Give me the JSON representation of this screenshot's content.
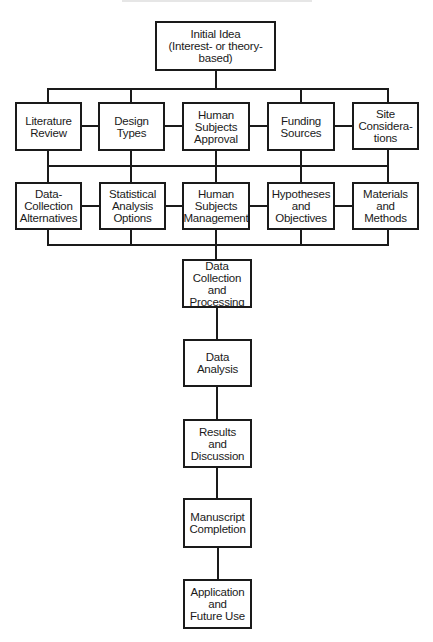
{
  "diagram": {
    "type": "flowchart",
    "root": {
      "id": "initial-idea",
      "label": "Initial Idea\n(Interest- or theory-based)"
    },
    "row1": [
      {
        "id": "literature-review",
        "label": "Literature\nReview"
      },
      {
        "id": "design-types",
        "label": "Design\nTypes"
      },
      {
        "id": "human-subjects-approval",
        "label": "Human\nSubjects\nApproval"
      },
      {
        "id": "funding-sources",
        "label": "Funding\nSources"
      },
      {
        "id": "site-considerations",
        "label": "Site\nConsidera-\ntions"
      }
    ],
    "row2": [
      {
        "id": "data-collection-alternatives",
        "label": "Data-\nCollection\nAlternatives"
      },
      {
        "id": "statistical-analysis-options",
        "label": "Statistical\nAnalysis\nOptions"
      },
      {
        "id": "human-subjects-management",
        "label": "Human\nSubjects\nManagement"
      },
      {
        "id": "hypotheses-and-objectives",
        "label": "Hypotheses\nand\nObjectives"
      },
      {
        "id": "materials-and-methods",
        "label": "Materials\nand\nMethods"
      }
    ],
    "sequence": [
      {
        "id": "data-collection-processing",
        "label": "Data\nCollection and\nProcessing"
      },
      {
        "id": "data-analysis",
        "label": "Data\nAnalysis"
      },
      {
        "id": "results-discussion",
        "label": "Results\nand\nDiscussion"
      },
      {
        "id": "manuscript-completion",
        "label": "Manuscript\nCompletion"
      },
      {
        "id": "application-future-use",
        "label": "Application\nand\nFuture Use"
      }
    ],
    "edges": [
      [
        "initial-idea",
        "row1"
      ],
      [
        "row1",
        "row2"
      ],
      [
        "row2",
        "data-collection-processing"
      ],
      [
        "data-collection-processing",
        "data-analysis"
      ],
      [
        "data-analysis",
        "results-discussion"
      ],
      [
        "results-discussion",
        "manuscript-completion"
      ],
      [
        "manuscript-completion",
        "application-future-use"
      ]
    ],
    "colors": {
      "stroke": "#1a1a1a",
      "background": "#ffffff"
    }
  }
}
